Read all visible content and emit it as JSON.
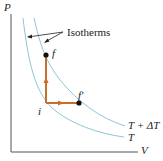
{
  "diagram": {
    "axes": {
      "y_label": "P",
      "x_label": "V"
    },
    "callout": {
      "label": "Isotherms"
    },
    "curves": [
      {
        "name": "isotherm-t",
        "label": "T",
        "color": "#8fc6d8"
      },
      {
        "name": "isotherm-t-plus-dt",
        "label": "T + ΔT",
        "color": "#8fc6d8"
      }
    ],
    "points": [
      {
        "name": "i",
        "label": "i"
      },
      {
        "name": "f",
        "label": "f"
      },
      {
        "name": "f-prime",
        "label": "f′"
      }
    ],
    "paths": [
      {
        "from": "i",
        "to": "f",
        "direction": "up",
        "color": "#c8702a"
      },
      {
        "from": "i",
        "to": "f′",
        "direction": "right",
        "color": "#c8702a"
      }
    ]
  }
}
